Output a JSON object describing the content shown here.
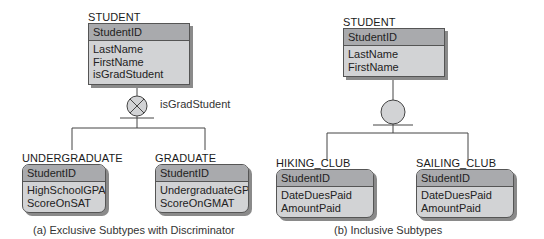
{
  "diagram_a": {
    "caption": "(a) Exclusive Subtypes with Discriminator",
    "supertype": {
      "name": "STUDENT",
      "key": "StudentID",
      "attributes": [
        "LastName",
        "FirstName",
        "isGradStudent"
      ]
    },
    "discriminator": {
      "symbol": "exclusive-x-circle",
      "label": "isGradStudent"
    },
    "subtypes": [
      {
        "name": "UNDERGRADUATE",
        "key": "StudentID",
        "attributes": [
          "HighSchoolGPA",
          "ScoreOnSAT"
        ]
      },
      {
        "name": "GRADUATE",
        "key": "StudentID",
        "attributes": [
          "UndergraduateGPA",
          "ScoreOnGMAT"
        ]
      }
    ]
  },
  "diagram_b": {
    "caption": "(b) Inclusive Subtypes",
    "supertype": {
      "name": "STUDENT",
      "key": "StudentID",
      "attributes": [
        "LastName",
        "FirstName"
      ]
    },
    "discriminator": {
      "symbol": "inclusive-circle"
    },
    "subtypes": [
      {
        "name": "HIKING_CLUB",
        "key": "StudentID",
        "attributes": [
          "DateDuesPaid",
          "AmountPaid"
        ]
      },
      {
        "name": "SAILING_CLUB",
        "key": "StudentID",
        "attributes": [
          "DateDuesPaid",
          "AmountPaid"
        ]
      }
    ]
  },
  "colors": {
    "key_band": "#a9aaad",
    "body": "#d2d3d5",
    "border": "#555555",
    "shadow": "#8a8a8a",
    "circle_fill": "#d2d3d5"
  }
}
